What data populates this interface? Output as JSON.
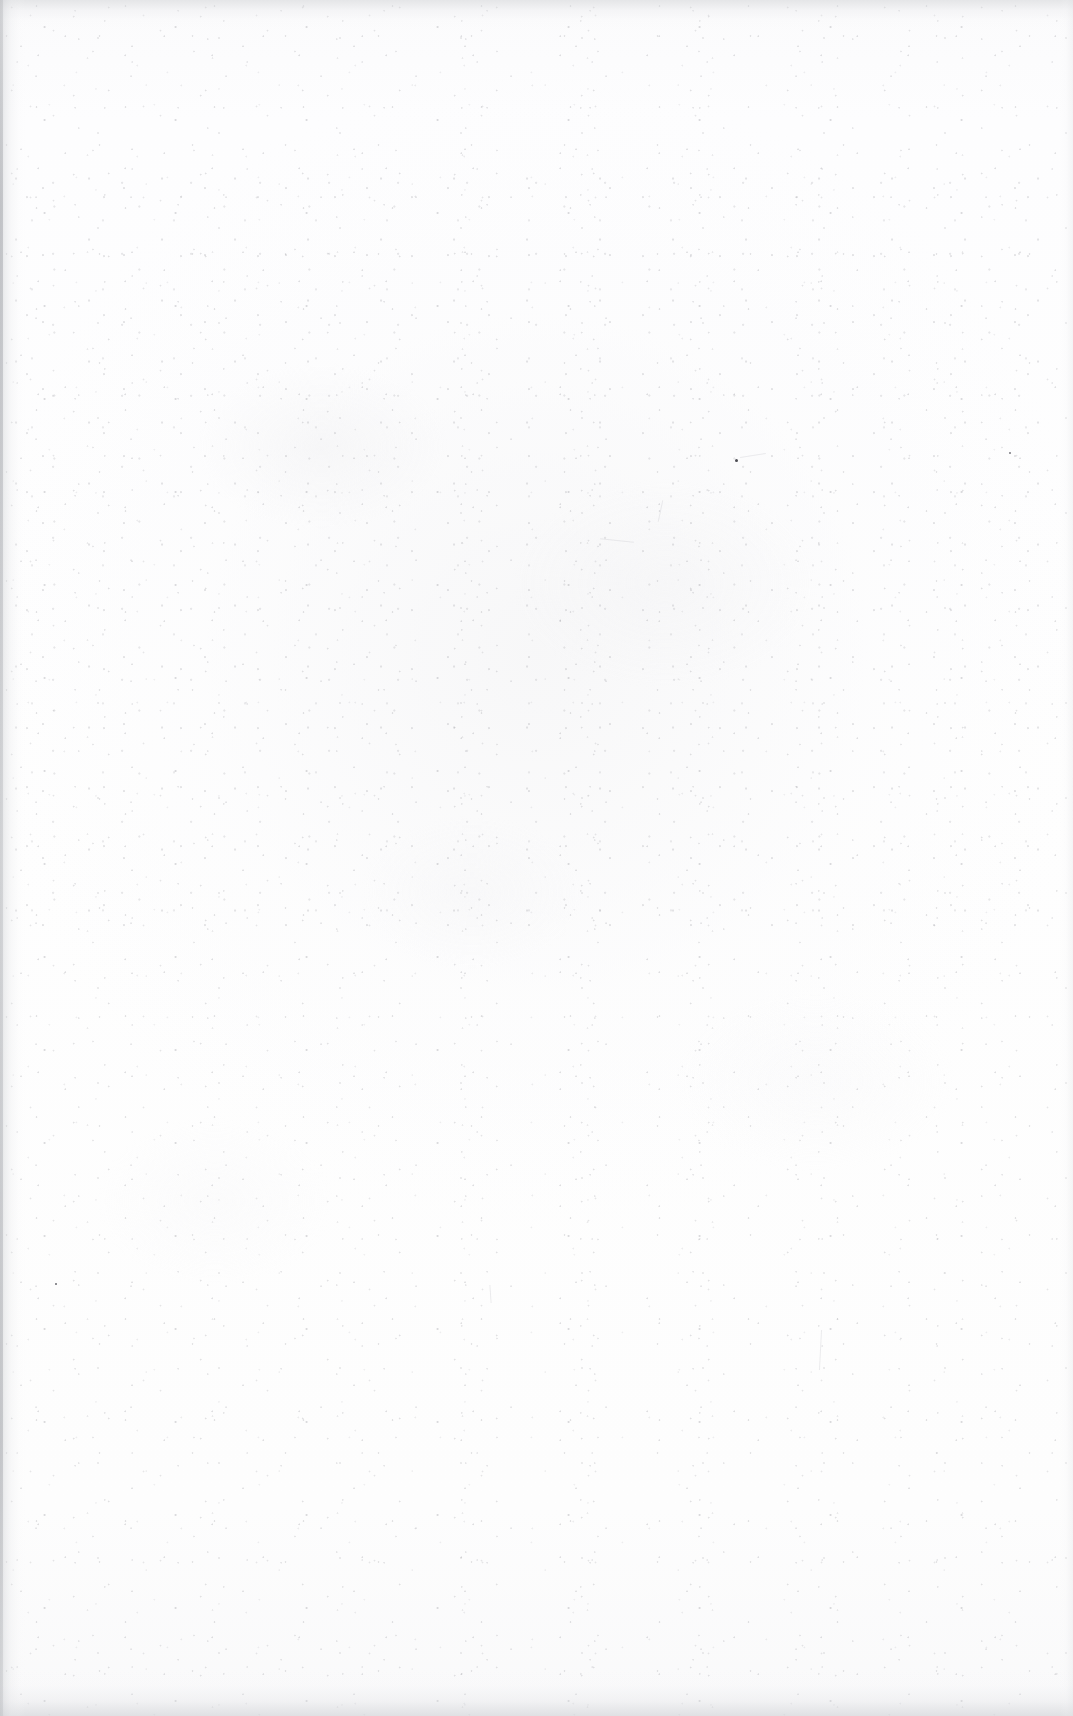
{
  "page": {
    "kind": "scanned-document-page",
    "state": "blank",
    "width": 1073,
    "height": 1716,
    "printed_text": "",
    "page_number": "",
    "header": "",
    "footer": "",
    "body_text": ""
  },
  "paper": {
    "background_color": "#fdfdfd",
    "base_tone": "#fefefe",
    "shaded_tone": "#f6f6f7"
  },
  "artifacts": {
    "gutter_edge": {
      "position": "left",
      "color": "#c4c6c9",
      "description": "binding gutter shadow"
    },
    "top_edge": {
      "position": "top",
      "color": "#ced0d3",
      "description": "scan edge shadow band"
    },
    "bottom_edge": {
      "position": "bottom",
      "color": "#c8cace",
      "description": "scan edge shadow band"
    },
    "right_edge": {
      "position": "right",
      "color": "#e2e3e6",
      "description": "faint scan edge"
    },
    "speckles": {
      "color": "#8c8c92",
      "description": "foxing and dust specks",
      "densest_region": "upper-middle"
    },
    "dark_specks": [
      {
        "label": "dark-speck-center",
        "x": 735,
        "y": 459,
        "color": "#4c4c52"
      },
      {
        "label": "dark-speck-left",
        "x": 55,
        "y": 1283,
        "color": "#6a6a71"
      },
      {
        "label": "dark-speck-right",
        "x": 1009,
        "y": 452,
        "color": "#7a7a81"
      }
    ]
  }
}
